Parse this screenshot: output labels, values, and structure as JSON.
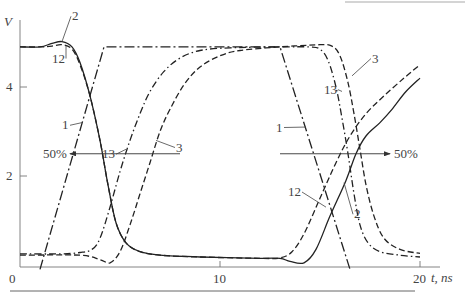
{
  "chart_data": {
    "type": "line",
    "title": "",
    "xlabel": "t, ns",
    "ylabel": "V",
    "xlim": [
      0,
      21
    ],
    "ylim": [
      0,
      5.3
    ],
    "grid": false,
    "x_ticks": [
      {
        "value": 0,
        "label": "0"
      },
      {
        "value": 10,
        "label": "10"
      },
      {
        "value": 20,
        "label": "20"
      }
    ],
    "y_ticks": [
      {
        "value": 2,
        "label": "2"
      },
      {
        "value": 4,
        "label": "4"
      }
    ],
    "series": [
      {
        "name": "1",
        "style": "dash-dot-long",
        "points": [
          [
            1.0,
            -0.1
          ],
          [
            4.2,
            4.9
          ],
          [
            13.0,
            4.9
          ],
          [
            16.5,
            -0.1
          ]
        ]
      },
      {
        "name": "2",
        "style": "solid",
        "points": [
          [
            0,
            4.9
          ],
          [
            1.0,
            4.9
          ],
          [
            1.6,
            4.98
          ],
          [
            2.1,
            5.02
          ],
          [
            2.6,
            4.9
          ],
          [
            3.0,
            4.55
          ],
          [
            3.5,
            3.8
          ],
          [
            4.0,
            2.8
          ],
          [
            4.4,
            1.8
          ],
          [
            4.8,
            0.95
          ],
          [
            5.3,
            0.5
          ],
          [
            6.0,
            0.3
          ],
          [
            7.0,
            0.22
          ],
          [
            9.0,
            0.18
          ],
          [
            12.0,
            0.15
          ],
          [
            13.0,
            0.15
          ],
          [
            13.5,
            0.08
          ],
          [
            14.2,
            0.05
          ],
          [
            14.8,
            0.35
          ],
          [
            15.5,
            1.1
          ],
          [
            16.3,
            1.9
          ],
          [
            16.8,
            2.5
          ],
          [
            17.3,
            2.9
          ],
          [
            18.0,
            3.2
          ],
          [
            18.6,
            3.5
          ],
          [
            19.3,
            3.9
          ],
          [
            20.0,
            4.2
          ]
        ]
      },
      {
        "name": "12",
        "style": "dashed",
        "points": [
          [
            0,
            4.9
          ],
          [
            1.0,
            4.9
          ],
          [
            1.6,
            4.92
          ],
          [
            2.1,
            4.95
          ],
          [
            2.6,
            4.85
          ],
          [
            3.0,
            4.5
          ],
          [
            3.5,
            3.8
          ],
          [
            4.0,
            2.8
          ],
          [
            4.4,
            1.8
          ],
          [
            4.8,
            0.95
          ],
          [
            5.3,
            0.5
          ],
          [
            6.0,
            0.3
          ],
          [
            7.0,
            0.22
          ],
          [
            9.0,
            0.18
          ],
          [
            12.0,
            0.15
          ],
          [
            13.0,
            0.16
          ],
          [
            13.6,
            0.3
          ],
          [
            14.2,
            0.7
          ],
          [
            15.0,
            1.5
          ],
          [
            15.8,
            2.3
          ],
          [
            16.5,
            2.9
          ],
          [
            17.3,
            3.4
          ],
          [
            18.2,
            3.8
          ],
          [
            19.2,
            4.2
          ],
          [
            20.0,
            4.5
          ]
        ]
      },
      {
        "name": "13",
        "style": "dash-dot",
        "points": [
          [
            0,
            0.25
          ],
          [
            2.0,
            0.25
          ],
          [
            3.0,
            0.28
          ],
          [
            3.6,
            0.35
          ],
          [
            4.0,
            0.6
          ],
          [
            4.5,
            1.3
          ],
          [
            5.0,
            2.1
          ],
          [
            5.5,
            2.8
          ],
          [
            6.0,
            3.4
          ],
          [
            6.5,
            3.9
          ],
          [
            7.2,
            4.35
          ],
          [
            8.0,
            4.65
          ],
          [
            9.0,
            4.82
          ],
          [
            10.5,
            4.88
          ],
          [
            13.0,
            4.9
          ],
          [
            14.5,
            4.9
          ],
          [
            15.0,
            4.85
          ],
          [
            15.4,
            4.6
          ],
          [
            15.8,
            4.0
          ],
          [
            16.1,
            3.3
          ],
          [
            16.4,
            2.5
          ],
          [
            16.7,
            1.6
          ],
          [
            17.0,
            0.9
          ],
          [
            17.4,
            0.5
          ],
          [
            18.0,
            0.3
          ],
          [
            19.0,
            0.22
          ],
          [
            20.0,
            0.18
          ]
        ]
      },
      {
        "name": "3",
        "style": "dashed",
        "points": [
          [
            0,
            0.22
          ],
          [
            3.0,
            0.22
          ],
          [
            4.0,
            0.12
          ],
          [
            4.5,
            0.05
          ],
          [
            5.0,
            0.3
          ],
          [
            5.5,
            0.9
          ],
          [
            6.0,
            1.6
          ],
          [
            6.5,
            2.3
          ],
          [
            7.0,
            3.0
          ],
          [
            7.5,
            3.5
          ],
          [
            8.2,
            4.05
          ],
          [
            9.0,
            4.45
          ],
          [
            10.0,
            4.7
          ],
          [
            11.0,
            4.82
          ],
          [
            13.0,
            4.9
          ],
          [
            15.0,
            4.95
          ],
          [
            15.6,
            4.92
          ],
          [
            16.0,
            4.7
          ],
          [
            16.4,
            4.1
          ],
          [
            16.7,
            3.4
          ],
          [
            17.0,
            2.6
          ],
          [
            17.3,
            1.8
          ],
          [
            17.7,
            1.1
          ],
          [
            18.2,
            0.6
          ],
          [
            19.0,
            0.35
          ],
          [
            20.0,
            0.26
          ]
        ]
      }
    ],
    "annotations": [
      {
        "text": "50%",
        "type": "arrow-left",
        "y_value": 2.5,
        "x_range": [
          2.5,
          8.0
        ]
      },
      {
        "text": "50%",
        "type": "arrow-right",
        "y_value": 2.5,
        "x_range": [
          13.0,
          18.5
        ]
      }
    ],
    "curve_labels": [
      {
        "text": "2",
        "at": [
          2.1,
          5.02
        ],
        "label_pos": [
          2.6,
          5.5
        ]
      },
      {
        "text": "12",
        "at": [
          2.3,
          4.93
        ],
        "label_pos": [
          1.6,
          4.55
        ]
      },
      {
        "text": "1",
        "at": [
          3.1,
          3.2
        ],
        "label_pos": [
          2.1,
          3.05
        ]
      },
      {
        "text": "13",
        "at": [
          5.3,
          2.6
        ],
        "label_pos": [
          4.1,
          2.4
        ]
      },
      {
        "text": "3",
        "at": [
          6.8,
          2.8
        ],
        "label_pos": [
          7.8,
          2.55
        ]
      },
      {
        "text": "1",
        "at": [
          14.3,
          3.1
        ],
        "label_pos": [
          12.8,
          3.0
        ]
      },
      {
        "text": "12",
        "at": [
          15.3,
          1.3
        ],
        "label_pos": [
          13.4,
          1.55
        ]
      },
      {
        "text": "2",
        "at": [
          16.2,
          1.85
        ],
        "label_pos": [
          16.7,
          1.05
        ]
      },
      {
        "text": "3",
        "at": [
          16.6,
          4.25
        ],
        "label_pos": [
          17.6,
          4.55
        ]
      },
      {
        "text": "13",
        "at": [
          16.1,
          3.9
        ],
        "label_pos": [
          15.2,
          3.85
        ]
      }
    ]
  }
}
